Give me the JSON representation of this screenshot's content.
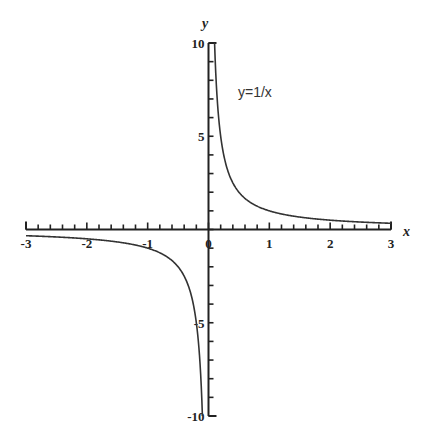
{
  "chart_data": {
    "type": "line",
    "title": "",
    "function": "y = 1/x",
    "annotation": "y=1/x",
    "xlabel": "x",
    "ylabel": "y",
    "xlim": [
      -3,
      3
    ],
    "ylim": [
      -10,
      10
    ],
    "grid": false,
    "legend": "none",
    "x_tick_labels": [
      "-3",
      "-2",
      "-1",
      "0",
      "1",
      "2",
      "3"
    ],
    "x_ticks": [
      -3,
      -2,
      -1,
      0,
      1,
      2,
      3
    ],
    "y_tick_labels": [
      "10",
      "5",
      "-5",
      "-10"
    ],
    "y_ticks": [
      10,
      5,
      -5,
      -10
    ],
    "series": [
      {
        "name": "y=1/x (x>0)",
        "x": [
          0.1,
          0.15,
          0.2,
          0.25,
          0.3,
          0.4,
          0.5,
          0.75,
          1,
          1.5,
          2,
          2.5,
          3
        ],
        "y": [
          10,
          6.67,
          5,
          4,
          3.33,
          2.5,
          2,
          1.33,
          1,
          0.67,
          0.5,
          0.4,
          0.33
        ]
      },
      {
        "name": "y=1/x (x<0)",
        "x": [
          -3,
          -2.5,
          -2,
          -1.5,
          -1,
          -0.75,
          -0.5,
          -0.4,
          -0.3,
          -0.25,
          -0.2,
          -0.15,
          -0.1
        ],
        "y": [
          -0.33,
          -0.4,
          -0.5,
          -0.67,
          -1,
          -1.33,
          -2,
          -2.5,
          -3.33,
          -4,
          -5,
          -6.67,
          -10
        ]
      }
    ]
  },
  "labels": {
    "x_axis": "x",
    "y_axis": "y",
    "annotation": "y=1/x",
    "x_ticks": [
      "-3",
      "-2",
      "-1",
      "0",
      "1",
      "2",
      "3"
    ],
    "y_ticks": [
      "10",
      "5",
      "-5",
      "-10"
    ]
  }
}
